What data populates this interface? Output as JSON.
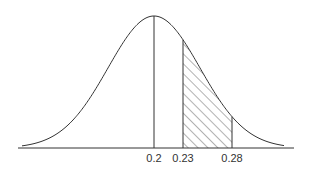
{
  "figure": {
    "type": "normal-distribution-diagram",
    "colors": {
      "stroke": "#333333",
      "hatch": "#555555",
      "background": "#ffffff"
    },
    "mean": 0.2,
    "shaded_region": {
      "from": 0.23,
      "to": 0.28,
      "fill": "diagonal-hatch"
    },
    "labels": [
      {
        "value": 0.2,
        "text": "0.2"
      },
      {
        "value": 0.23,
        "text": "0.23"
      },
      {
        "value": 0.28,
        "text": "0.28"
      }
    ]
  },
  "layout": {
    "axis": {
      "x1": 18,
      "x2": 294,
      "y": 148
    },
    "curve": {
      "x_start": 22,
      "x_end": 284,
      "peak_x": 154,
      "peak_y": 16,
      "sigma_px": 46
    },
    "value_to_px": {
      "0.2": 154,
      "0.23": 183,
      "0.28": 232
    },
    "label_y": 162
  }
}
